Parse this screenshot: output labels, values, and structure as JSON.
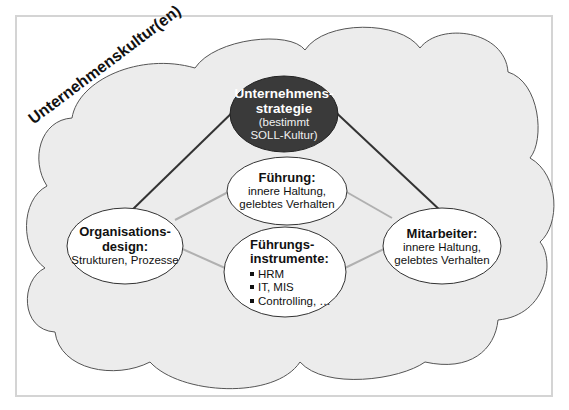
{
  "diagram": {
    "culture_label": "Unternehmenskultur(en)",
    "nodes": {
      "strategy": {
        "title_line1": "Unternehmens-",
        "title_line2": "strategie",
        "sub_line1": "(bestimmt",
        "sub_line2": "SOLL-Kultur)"
      },
      "leadership": {
        "title": "Führung:",
        "sub_line1": "innere Haltung,",
        "sub_line2": "gelebtes Verhalten"
      },
      "org_design": {
        "title_line1": "Organisations-",
        "title_line2": "design:",
        "sub": "Strukturen, Prozesse"
      },
      "tools": {
        "title_line1": "Führungs-",
        "title_line2": "instrumente:",
        "items": [
          "HRM",
          "IT, MIS",
          "Controlling, …"
        ]
      },
      "employees": {
        "title": "Mitarbeiter:",
        "sub_line1": "innere Haltung,",
        "sub_line2": "gelebtes Verhalten"
      }
    },
    "colors": {
      "cloud_fill": "#ececec",
      "cloud_stroke": "#555555",
      "strategy_fill": "#3a3a3a",
      "node_fill": "#ffffff",
      "main_line": "#333333",
      "secondary_line": "#b0b0b0",
      "frame": "#d4d4d4"
    }
  }
}
